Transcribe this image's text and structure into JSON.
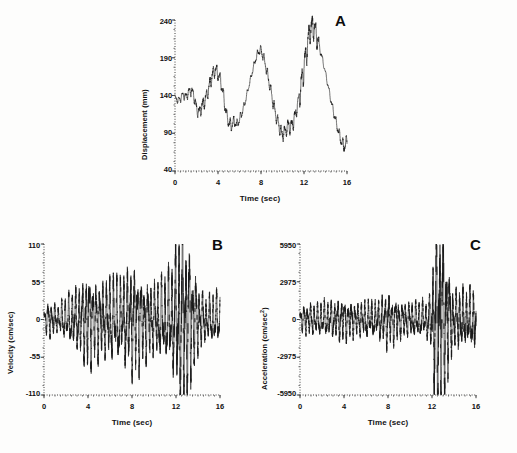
{
  "figure": {
    "title": "",
    "background_color": "#fdfdfc",
    "trace_color": "#1a1a1a",
    "axis_color": "#2b2b2b"
  },
  "panels": [
    {
      "letter": "A",
      "ylabel": "Displacement (mm)",
      "xlabel": "Time (sec)",
      "yticks": [
        "40",
        "90",
        "140",
        "190",
        "240"
      ],
      "xticks": [
        "0",
        "4",
        "8",
        "12",
        "16"
      ]
    },
    {
      "letter": "B",
      "ylabel": "Velocity (cm/sec)",
      "xlabel": "Time (sec)",
      "yticks": [
        "-110",
        "-55",
        "0",
        "55",
        "110"
      ],
      "xticks": [
        "0",
        "4",
        "8",
        "12",
        "16"
      ]
    },
    {
      "letter": "C",
      "ylabel": "Acceleration (cm/sec2)",
      "ylabel_base": "Acceleration (cm/sec",
      "ylabel_exp": "2",
      "ylabel_tail": ")",
      "xlabel": "Time (sec)",
      "yticks": [
        "-5950",
        "-2975",
        "0",
        "2975",
        "5950"
      ],
      "xticks": [
        "0",
        "4",
        "8",
        "12",
        "16"
      ]
    }
  ],
  "chart_data": [
    {
      "type": "line",
      "panel": "A",
      "title": "Displacement",
      "xlabel": "Time (sec)",
      "ylabel": "Displacement (mm)",
      "xlim": [
        0,
        16
      ],
      "ylim": [
        40,
        240
      ],
      "xticks": [
        0,
        4,
        8,
        12,
        16
      ],
      "yticks": [
        40,
        90,
        140,
        190,
        240
      ],
      "grid": false,
      "legend": "none",
      "description": "Slow quasi-periodic oscillation of roughly 3.5 s period with a high-frequency ripple superimposed; mean level drifts downward while peak amplitude grows until t=12.5 s then decays.",
      "series": [
        {
          "name": "displacement",
          "x": [
            0.0,
            0.25,
            0.5,
            0.75,
            1.0,
            1.25,
            1.5,
            1.75,
            2.0,
            2.25,
            2.5,
            2.75,
            3.0,
            3.25,
            3.5,
            3.75,
            4.0,
            4.25,
            4.5,
            4.75,
            5.0,
            5.25,
            5.5,
            5.75,
            6.0,
            6.25,
            6.5,
            6.75,
            7.0,
            7.25,
            7.5,
            7.75,
            8.0,
            8.25,
            8.5,
            8.75,
            9.0,
            9.25,
            9.5,
            9.75,
            10.0,
            10.25,
            10.5,
            10.75,
            11.0,
            11.25,
            11.5,
            11.75,
            12.0,
            12.25,
            12.5,
            12.75,
            13.0,
            13.25,
            13.5,
            13.75,
            14.0,
            14.25,
            14.5,
            14.75,
            15.0,
            15.25,
            15.5,
            15.75,
            16.0
          ],
          "values": [
            138,
            133,
            136,
            141,
            138,
            144,
            147,
            141,
            122,
            117,
            125,
            133,
            142,
            155,
            168,
            175,
            168,
            160,
            140,
            118,
            104,
            100,
            106,
            101,
            108,
            118,
            130,
            145,
            160,
            175,
            188,
            198,
            200,
            190,
            175,
            158,
            140,
            122,
            108,
            96,
            88,
            92,
            100,
            98,
            104,
            118,
            135,
            155,
            178,
            200,
            222,
            232,
            228,
            215,
            200,
            186,
            170,
            152,
            134,
            118,
            104,
            90,
            78,
            72,
            80
          ]
        }
      ]
    },
    {
      "type": "line",
      "panel": "B",
      "title": "Velocity",
      "xlabel": "Time (sec)",
      "ylabel": "Velocity (cm/sec)",
      "xlim": [
        0,
        16
      ],
      "ylim": [
        -110,
        110
      ],
      "xticks": [
        0,
        4,
        8,
        12,
        16
      ],
      "yticks": [
        -110,
        -55,
        0,
        55,
        110
      ],
      "grid": false,
      "legend": "none",
      "description": "Dense high-frequency oscillation about zero. Envelope grows from about +/-15 near t=0 to roughly +/-50 between t=4 and t=11, with a strong burst reaching about +/-100 at t=12 to 13 s, then decaying to about +/-25.",
      "envelope_x": [
        0,
        0.6,
        1.2,
        1.8,
        2.6,
        3.4,
        4.0,
        4.6,
        5.4,
        6.2,
        7.0,
        7.8,
        8.2,
        9.0,
        9.8,
        10.6,
        11.2,
        11.8,
        12.2,
        12.5,
        12.8,
        13.2,
        13.6,
        14.2,
        14.8,
        15.4,
        16.0
      ],
      "envelope_y": [
        14,
        18,
        13,
        20,
        28,
        36,
        50,
        40,
        38,
        44,
        40,
        52,
        55,
        42,
        36,
        40,
        44,
        58,
        82,
        100,
        95,
        72,
        50,
        30,
        22,
        26,
        24
      ],
      "dominant_frequency_hz": 3.2
    },
    {
      "type": "line",
      "panel": "C",
      "title": "Acceleration",
      "xlabel": "Time (sec)",
      "ylabel": "Acceleration (cm/sec2)",
      "xlim": [
        0,
        16
      ],
      "ylim": [
        -5950,
        5950
      ],
      "xticks": [
        0,
        4,
        8,
        12,
        16
      ],
      "yticks": [
        -5950,
        -2975,
        0,
        2975,
        5950
      ],
      "grid": false,
      "legend": "none",
      "description": "Low-amplitude dense oscillation near zero (about +/-900) for most of the record, with a large burst between t=12 and t=13.5 s reaching nearly +/-5950, then decaying to about +/-1400.",
      "envelope_x": [
        0,
        0.6,
        1.4,
        2.2,
        3.0,
        3.8,
        4.4,
        5.2,
        6.0,
        6.8,
        7.6,
        8.0,
        8.4,
        9.2,
        10.0,
        10.8,
        11.4,
        11.9,
        12.2,
        12.5,
        12.8,
        13.1,
        13.5,
        14.0,
        14.6,
        15.2,
        16.0
      ],
      "envelope_y": [
        700,
        850,
        800,
        950,
        900,
        1150,
        1000,
        900,
        1000,
        950,
        1300,
        1500,
        1300,
        950,
        900,
        1000,
        900,
        1600,
        4200,
        5800,
        5200,
        4400,
        2600,
        1500,
        1700,
        1500,
        1800
      ],
      "dominant_frequency_hz": 3.2
    }
  ]
}
